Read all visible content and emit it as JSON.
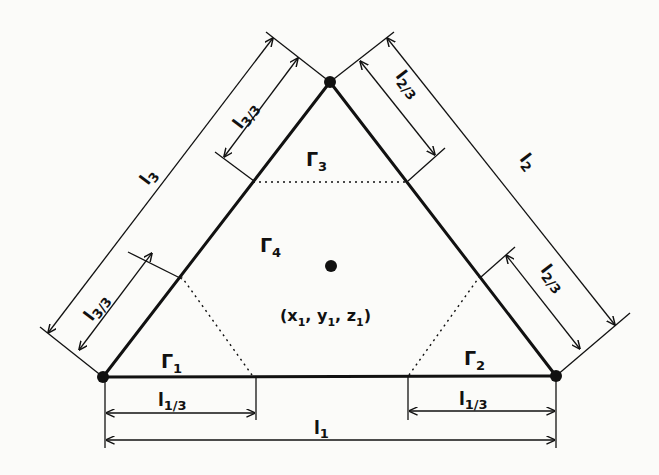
{
  "figure": {
    "type": "triangular element diagram",
    "colors": {
      "ink": "#111111",
      "paper": "#fbfbf9",
      "bleed_through": "#e6e6e3"
    },
    "vertices": {
      "apex": {
        "x": 330,
        "y": 82
      },
      "left": {
        "x": 103,
        "y": 377
      },
      "right": {
        "x": 556,
        "y": 376
      }
    },
    "center_point": {
      "x": 331,
      "y": 265
    },
    "regions": {
      "gamma1": "Γ",
      "gamma1_sub": "1",
      "gamma2": "Γ",
      "gamma2_sub": "2",
      "gamma3": "Γ",
      "gamma3_sub": "3",
      "gamma4": "Γ",
      "gamma4_sub": "4"
    },
    "center_label": "(x",
    "center_label_parts": [
      "(x",
      "1",
      ", y",
      "1",
      ", z",
      "1",
      ")"
    ],
    "dimensions": {
      "l1": {
        "base": "l",
        "sub": "1"
      },
      "l1_third_left": {
        "base": "l",
        "sub": "1/3"
      },
      "l1_third_right": {
        "base": "l",
        "sub": "1/3"
      },
      "l2": {
        "base": "l",
        "sub": "2"
      },
      "l2_third_top": {
        "base": "l",
        "sub": "2/3"
      },
      "l2_third_bottom": {
        "base": "l",
        "sub": "2/3"
      },
      "l3": {
        "base": "l",
        "sub": "3"
      },
      "l3_third_top": {
        "base": "l",
        "sub": "3/3"
      },
      "l3_third_bottom": {
        "base": "l",
        "sub": "3/3"
      }
    }
  }
}
